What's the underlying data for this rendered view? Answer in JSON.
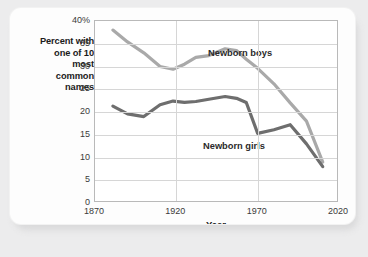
{
  "chart_data": {
    "type": "line",
    "title": "",
    "xlabel": "Year",
    "ylabel": "Percent with one of 10 most common names",
    "ylabel_lines": [
      "Percent with",
      "one of 10",
      "most",
      "common",
      "names"
    ],
    "xlim": [
      1870,
      2020
    ],
    "ylim": [
      0,
      40
    ],
    "xticks": [
      "1870",
      "1920",
      "1970",
      "2020"
    ],
    "xtick_values": [
      1870,
      1920,
      1970,
      2020
    ],
    "yticks": [
      "0",
      "5",
      "10",
      "15",
      "20",
      "25",
      "30",
      "35",
      "40%"
    ],
    "ytick_values": [
      0,
      5,
      10,
      15,
      20,
      25,
      30,
      35,
      40
    ],
    "grid": "horizontal-and-vertical",
    "legend_position": "in-plot-annotations",
    "series": [
      {
        "name": "Newborn boys",
        "color": "#a9a9a9",
        "x": [
          1881,
          1890,
          1900,
          1910,
          1918,
          1925,
          1932,
          1940,
          1950,
          1957,
          1963,
          1970,
          1980,
          1990,
          2000,
          2010
        ],
        "values": [
          38.0,
          35.4,
          33.0,
          30.0,
          29.4,
          30.5,
          32.0,
          32.4,
          33.9,
          33.5,
          31.6,
          29.6,
          26.2,
          22.0,
          18.0,
          9.0
        ]
      },
      {
        "name": "Newborn girls",
        "color": "#6e6e6e",
        "x": [
          1881,
          1890,
          1900,
          1910,
          1918,
          1925,
          1932,
          1940,
          1950,
          1957,
          1963,
          1970,
          1980,
          1990,
          2000,
          2010
        ],
        "values": [
          21.3,
          19.6,
          19.0,
          21.6,
          22.4,
          22.1,
          22.3,
          22.8,
          23.4,
          23.0,
          22.1,
          15.3,
          16.1,
          17.2,
          13.0,
          8.0
        ]
      }
    ],
    "annotations": [
      {
        "text": "Newborn boys",
        "series": "Newborn boys"
      },
      {
        "text": "Newborn girls",
        "series": "Newborn girls"
      }
    ]
  }
}
